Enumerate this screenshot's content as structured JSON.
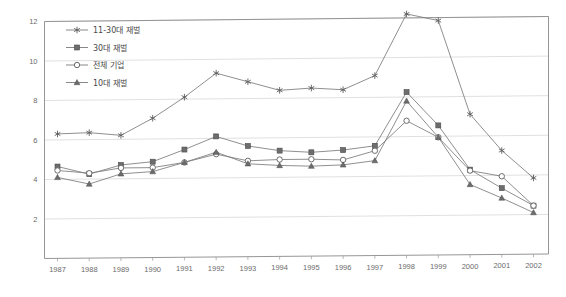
{
  "chart_data": {
    "type": "line",
    "title": "",
    "subtitle": "",
    "xlabel": "",
    "ylabel": "",
    "grid": true,
    "legend_position": "top-left",
    "categories": [
      "1987",
      "1988",
      "1989",
      "1990",
      "1991",
      "1992",
      "1993",
      "1994",
      "1995",
      "1996",
      "1997",
      "1998",
      "1999",
      "2000",
      "2001",
      "2002"
    ],
    "x": [
      1987,
      1988,
      1989,
      1990,
      1991,
      1992,
      1993,
      1994,
      1995,
      1996,
      1997,
      1998,
      1999,
      2000,
      2001,
      2002
    ],
    "ylim": [
      0,
      12
    ],
    "yticks": [
      2,
      4,
      6,
      8,
      10,
      12
    ],
    "ytick_labels": [
      "2",
      "4",
      "6",
      "8",
      "10",
      "12"
    ],
    "series": [
      {
        "name": "11-30대 재벌",
        "marker": "asterisk",
        "values": [
          6.3,
          6.35,
          6.2,
          7.05,
          8.1,
          9.3,
          8.85,
          8.4,
          8.5,
          8.4,
          9.1,
          12.2,
          11.85,
          7.1,
          5.25,
          3.85
        ]
      },
      {
        "name": "30대 재벌",
        "marker": "square",
        "values": [
          4.65,
          4.25,
          4.7,
          4.85,
          5.45,
          6.1,
          5.6,
          5.35,
          5.25,
          5.35,
          5.55,
          8.25,
          6.55,
          4.3,
          3.35,
          2.45
        ]
      },
      {
        "name": "전체 기업",
        "marker": "circle",
        "values": [
          4.45,
          4.3,
          4.55,
          4.55,
          4.8,
          5.2,
          4.85,
          4.9,
          4.9,
          4.85,
          5.3,
          6.8,
          5.95,
          4.25,
          3.95,
          2.45
        ]
      },
      {
        "name": "10대 재벌",
        "marker": "triangle",
        "values": [
          4.1,
          3.75,
          4.25,
          4.35,
          4.8,
          5.3,
          4.7,
          4.6,
          4.55,
          4.6,
          4.8,
          7.8,
          5.95,
          3.55,
          2.85,
          2.1
        ]
      }
    ]
  },
  "legend": {
    "items": [
      {
        "label": "11-30대 재벌",
        "marker": "asterisk"
      },
      {
        "label": "30대 재벌",
        "marker": "square"
      },
      {
        "label": "전체 기업",
        "marker": "circle"
      },
      {
        "label": "10대 재벌",
        "marker": "triangle"
      }
    ]
  },
  "axis": {
    "y_tick_labels": [
      "12",
      "10",
      "8",
      "6",
      "4",
      "2"
    ],
    "x_tick_labels": [
      "1987",
      "1988",
      "1989",
      "1990",
      "1991",
      "1992",
      "1993",
      "1994",
      "1995",
      "1996",
      "1997",
      "1998",
      "1999",
      "2000",
      "2001",
      "2002"
    ]
  },
  "colors": {
    "line": "#7b7b7b",
    "grid": "#d2d2d2",
    "frame": "#8a8a8a",
    "text": "#6b6b6b",
    "background": "#ffffff"
  }
}
